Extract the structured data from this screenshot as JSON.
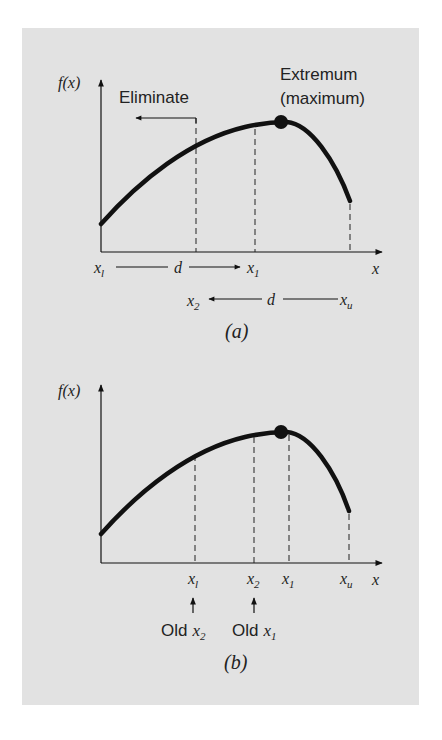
{
  "figure": {
    "panel_a": {
      "y_axis_label": "f(x)",
      "x_axis_label": "x",
      "eliminate_label": "Eliminate",
      "extremum_label_line1": "Extremum",
      "extremum_label_line2": "(maximum)",
      "point_labels": {
        "xl": "x",
        "xl_sub": "l",
        "x1": "x",
        "x1_sub": "1",
        "x2": "x",
        "x2_sub": "2",
        "xu": "x",
        "xu_sub": "u"
      },
      "distance_label": "d",
      "caption": "(a)"
    },
    "panel_b": {
      "y_axis_label": "f(x)",
      "x_axis_label": "x",
      "point_labels": {
        "xl": "x",
        "xl_sub": "l",
        "x2": "x",
        "x2_sub": "2",
        "x1": "x",
        "x1_sub": "1",
        "xu": "x",
        "xu_sub": "u"
      },
      "old_x2_label": "Old",
      "old_x2_var": "x",
      "old_x2_sub": "2",
      "old_x1_label": "Old",
      "old_x1_var": "x",
      "old_x1_sub": "1",
      "caption": "(b)"
    },
    "colors": {
      "panel_background": "#e2e2e2",
      "ink": "#111111"
    }
  }
}
